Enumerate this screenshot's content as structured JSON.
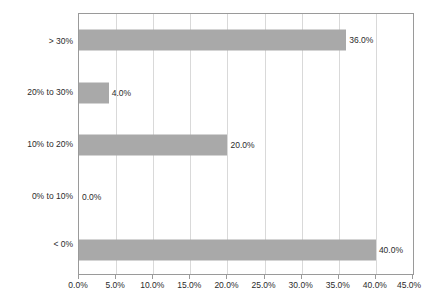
{
  "chart_data": {
    "type": "bar",
    "orientation": "horizontal",
    "title": "",
    "subtitle": "",
    "xlabel": "",
    "ylabel": "",
    "categories": [
      "< 0%",
      "0% to 10%",
      "10% to 20%",
      "20% to 30%",
      "> 30%"
    ],
    "values": [
      40.0,
      0.0,
      20.0,
      4.0,
      36.0
    ],
    "data_labels": [
      "40.0%",
      "0.0%",
      "20.0%",
      "4.0%",
      "36.0%"
    ],
    "xlim": [
      0.0,
      45.0
    ],
    "x_tick_values": [
      0.0,
      5.0,
      10.0,
      15.0,
      20.0,
      25.0,
      30.0,
      35.0,
      40.0,
      45.0
    ],
    "x_tick_labels": [
      "0.0%",
      "5.0%",
      "10.0%",
      "15.0%",
      "20.0%",
      "25.0%",
      "30.0%",
      "35.0%",
      "40.0%",
      "45.0%"
    ],
    "grid": "vertical",
    "legend": "none",
    "series": [
      {
        "name": "",
        "color": "#a9a9a9",
        "values": [
          40.0,
          0.0,
          20.0,
          4.0,
          36.0
        ]
      }
    ],
    "annotations": []
  },
  "style": {
    "bar_color": "#a9a9a9",
    "gridline_color": "#d9d9d9",
    "axis_color": "#9a9a9a",
    "text_color": "#2b2b2b",
    "background": "#ffffff"
  }
}
